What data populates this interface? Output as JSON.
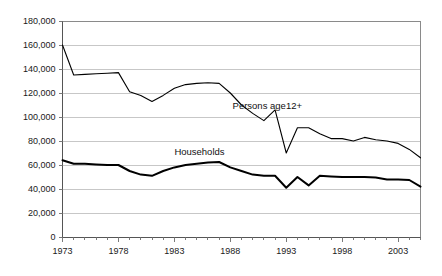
{
  "chart_data": {
    "type": "line",
    "title": "",
    "subtitle": "",
    "xlabel": "",
    "ylabel": "",
    "xlim": [
      1973,
      2005
    ],
    "ylim": [
      0,
      180000
    ],
    "grid": true,
    "grid_axis": "y",
    "legend": "inline-annotations",
    "x": [
      1973,
      1974,
      1975,
      1976,
      1977,
      1978,
      1979,
      1980,
      1981,
      1982,
      1983,
      1984,
      1985,
      1986,
      1987,
      1988,
      1989,
      1990,
      1991,
      1992,
      1993,
      1994,
      1995,
      1996,
      1997,
      1998,
      1999,
      2000,
      2001,
      2002,
      2003,
      2004,
      2005
    ],
    "x_tick_labels": [
      "1973",
      "1978",
      "1983",
      "1988",
      "1993",
      "1998",
      "2003"
    ],
    "x_tick_values": [
      1973,
      1978,
      1983,
      1988,
      1993,
      1998,
      2003
    ],
    "y_tick_labels": [
      "0",
      "20,000",
      "40,000",
      "60,000",
      "80,000",
      "100,000",
      "120,000",
      "140,000",
      "160,000",
      "180,000"
    ],
    "y_tick_values": [
      0,
      20000,
      40000,
      60000,
      80000,
      100000,
      120000,
      140000,
      160000,
      180000
    ],
    "series": [
      {
        "name": "Persons age12+",
        "label": "Persons age12+",
        "color": "#000000",
        "line_width": 1.1,
        "annotation_x": 1988.2,
        "annotation_y": 107000,
        "values": [
          160000,
          135000,
          135500,
          136000,
          136500,
          137000,
          121000,
          118000,
          113000,
          118000,
          124000,
          127000,
          128000,
          128500,
          128000,
          120000,
          110000,
          103000,
          97000,
          106000,
          70000,
          91000,
          91000,
          86000,
          82000,
          82000,
          80000,
          83000,
          81000,
          80000,
          78000,
          73000,
          66000
        ]
      },
      {
        "name": "Households",
        "label": "Households",
        "color": "#000000",
        "line_width": 2.0,
        "annotation_x": 1983.0,
        "annotation_y": 68500,
        "values": [
          64000,
          61000,
          61000,
          60500,
          60000,
          60000,
          55000,
          52000,
          51000,
          55000,
          58000,
          60000,
          61000,
          62000,
          62500,
          58000,
          55000,
          52000,
          51000,
          51000,
          41000,
          50000,
          43000,
          51000,
          50500,
          50000,
          50000,
          50000,
          49500,
          48000,
          48000,
          47500,
          42000
        ]
      }
    ]
  },
  "axes": {
    "y_axis_name": "counts-axis",
    "x_axis_name": "year-axis"
  }
}
